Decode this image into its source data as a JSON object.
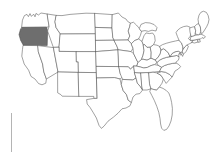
{
  "map": {
    "title": "United States state outline map",
    "type": "choropleth-single-highlight",
    "width": 216,
    "height": 154,
    "background_color": "#ffffff",
    "border_color": "#555555",
    "default_fill": "#ffffff",
    "highlight_fill": "#6e6e6e",
    "highlighted_states": [
      "Oregon"
    ],
    "highlighted_count": 1,
    "projection_note": "contiguous 48 states, Alaska and Hawaii not shown",
    "states": [
      {
        "name": "Washington",
        "abbr": "WA",
        "highlighted": false
      },
      {
        "name": "Oregon",
        "abbr": "OR",
        "highlighted": true
      },
      {
        "name": "California",
        "abbr": "CA",
        "highlighted": false
      },
      {
        "name": "Nevada",
        "abbr": "NV",
        "highlighted": false
      },
      {
        "name": "Idaho",
        "abbr": "ID",
        "highlighted": false
      },
      {
        "name": "Montana",
        "abbr": "MT",
        "highlighted": false
      },
      {
        "name": "Wyoming",
        "abbr": "WY",
        "highlighted": false
      },
      {
        "name": "Utah",
        "abbr": "UT",
        "highlighted": false
      },
      {
        "name": "Arizona",
        "abbr": "AZ",
        "highlighted": false
      },
      {
        "name": "Colorado",
        "abbr": "CO",
        "highlighted": false
      },
      {
        "name": "New Mexico",
        "abbr": "NM",
        "highlighted": false
      },
      {
        "name": "North Dakota",
        "abbr": "ND",
        "highlighted": false
      },
      {
        "name": "South Dakota",
        "abbr": "SD",
        "highlighted": false
      },
      {
        "name": "Nebraska",
        "abbr": "NE",
        "highlighted": false
      },
      {
        "name": "Kansas",
        "abbr": "KS",
        "highlighted": false
      },
      {
        "name": "Oklahoma",
        "abbr": "OK",
        "highlighted": false
      },
      {
        "name": "Texas",
        "abbr": "TX",
        "highlighted": false
      },
      {
        "name": "Minnesota",
        "abbr": "MN",
        "highlighted": false
      },
      {
        "name": "Iowa",
        "abbr": "IA",
        "highlighted": false
      },
      {
        "name": "Missouri",
        "abbr": "MO",
        "highlighted": false
      },
      {
        "name": "Arkansas",
        "abbr": "AR",
        "highlighted": false
      },
      {
        "name": "Louisiana",
        "abbr": "LA",
        "highlighted": false
      },
      {
        "name": "Wisconsin",
        "abbr": "WI",
        "highlighted": false
      },
      {
        "name": "Illinois",
        "abbr": "IL",
        "highlighted": false
      },
      {
        "name": "Michigan",
        "abbr": "MI",
        "highlighted": false
      },
      {
        "name": "Indiana",
        "abbr": "IN",
        "highlighted": false
      },
      {
        "name": "Ohio",
        "abbr": "OH",
        "highlighted": false
      },
      {
        "name": "Kentucky",
        "abbr": "KY",
        "highlighted": false
      },
      {
        "name": "Tennessee",
        "abbr": "TN",
        "highlighted": false
      },
      {
        "name": "Mississippi",
        "abbr": "MS",
        "highlighted": false
      },
      {
        "name": "Alabama",
        "abbr": "AL",
        "highlighted": false
      },
      {
        "name": "Georgia",
        "abbr": "GA",
        "highlighted": false
      },
      {
        "name": "Florida",
        "abbr": "FL",
        "highlighted": false
      },
      {
        "name": "South Carolina",
        "abbr": "SC",
        "highlighted": false
      },
      {
        "name": "North Carolina",
        "abbr": "NC",
        "highlighted": false
      },
      {
        "name": "Virginia",
        "abbr": "VA",
        "highlighted": false
      },
      {
        "name": "West Virginia",
        "abbr": "WV",
        "highlighted": false
      },
      {
        "name": "Maryland",
        "abbr": "MD",
        "highlighted": false
      },
      {
        "name": "Delaware",
        "abbr": "DE",
        "highlighted": false
      },
      {
        "name": "Pennsylvania",
        "abbr": "PA",
        "highlighted": false
      },
      {
        "name": "New Jersey",
        "abbr": "NJ",
        "highlighted": false
      },
      {
        "name": "New York",
        "abbr": "NY",
        "highlighted": false
      },
      {
        "name": "Connecticut",
        "abbr": "CT",
        "highlighted": false
      },
      {
        "name": "Rhode Island",
        "abbr": "RI",
        "highlighted": false
      },
      {
        "name": "Massachusetts",
        "abbr": "MA",
        "highlighted": false
      },
      {
        "name": "Vermont",
        "abbr": "VT",
        "highlighted": false
      },
      {
        "name": "New Hampshire",
        "abbr": "NH",
        "highlighted": false
      },
      {
        "name": "Maine",
        "abbr": "ME",
        "highlighted": false
      }
    ]
  },
  "artifacts": {
    "left_rule_color": "#b4b4b4"
  }
}
